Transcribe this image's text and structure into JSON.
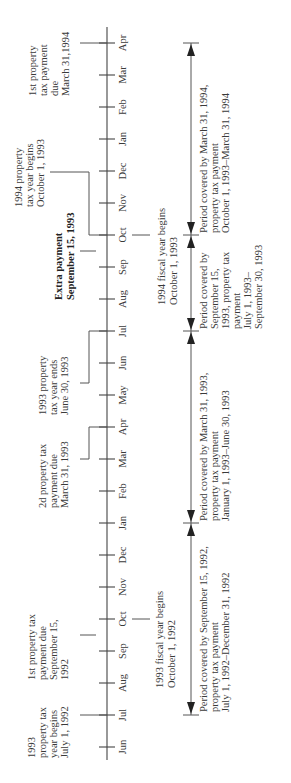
{
  "diagram": {
    "orientation": "rotated-90-ccw",
    "months_bottom_to_top": [
      "Jun",
      "Jul",
      "Aug",
      "Sep",
      "Oct",
      "Nov",
      "Dec",
      "Jan",
      "Feb",
      "Mar",
      "Apr",
      "May",
      "Jun",
      "Jul",
      "Aug",
      "Sep",
      "Oct",
      "Nov",
      "Dec",
      "Jan",
      "Feb",
      "Mar",
      "Apr"
    ],
    "top_annotations": [
      {
        "id": "1993-prop-begins",
        "lines": [
          "1993",
          "property tax",
          "year begins",
          "July 1, 1992"
        ],
        "bold": false
      },
      {
        "id": "1st-payment-1992",
        "lines": [
          "1st property tax",
          "payment due",
          "September 15,",
          "1992"
        ],
        "bold": false
      },
      {
        "id": "2d-payment",
        "lines": [
          "2d property tax",
          "payment due",
          "March 31, 1993"
        ],
        "bold": false
      },
      {
        "id": "1993-prop-ends",
        "lines": [
          "1993 property",
          "tax year ends",
          "June 30, 1993"
        ],
        "bold": false
      },
      {
        "id": "extra-payment",
        "lines": [
          "Extra payment",
          "September 15, 1993"
        ],
        "bold": true
      },
      {
        "id": "1994-prop-begins",
        "lines": [
          "1994 property",
          "tax year begins",
          "October 1, 1993"
        ],
        "bold": false
      },
      {
        "id": "1st-payment-1994",
        "lines": [
          "1st property",
          "tax payment",
          "due",
          "March 31,1994"
        ],
        "bold": false
      }
    ],
    "bottom_annotations": [
      {
        "id": "1993-fiscal",
        "lines": [
          "1993 fiscal year begins",
          "October 1, 1992"
        ]
      },
      {
        "id": "1994-fiscal",
        "lines": [
          "1994 fiscal year begins",
          "October 1, 1993"
        ]
      }
    ],
    "periods": [
      {
        "id": "period-1",
        "lines": [
          "Period covered by September 15, 1992,",
          "property tax payment",
          "July 1, 1992–December 31, 1992"
        ]
      },
      {
        "id": "period-2",
        "lines": [
          "Period covered by March 31, 1993,",
          "property tax payment",
          "January 1, 1993–June 30, 1993"
        ]
      },
      {
        "id": "period-3",
        "lines": [
          "Period covered by",
          "September 15,",
          "1993, property tax",
          "payment",
          "July 1, 1993–",
          "September 30, 1993"
        ]
      },
      {
        "id": "period-4",
        "lines": [
          "Period covered by March 31, 1994,",
          "property tax payment",
          "October 1, 1993–March 31, 1994"
        ]
      }
    ]
  }
}
